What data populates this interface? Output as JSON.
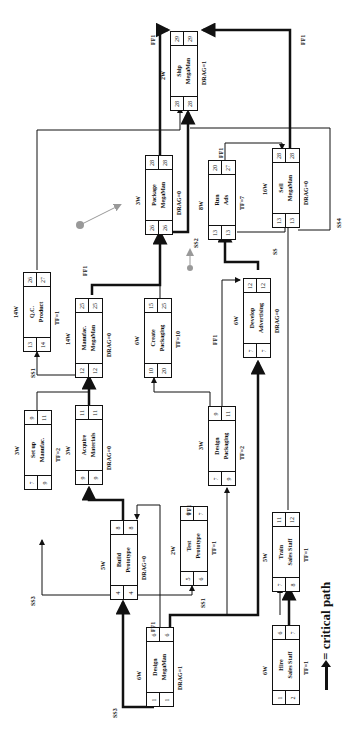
{
  "diagram": {
    "type": "project-network-critical-path",
    "orientation": "rotated-90-ccw",
    "nodes": [
      {
        "id": "design-megaman",
        "duration": "6W",
        "name_line1": "Design",
        "name_line2": "MegaMan",
        "es": "1",
        "ls": "1",
        "ef": "6",
        "lf": "6",
        "note": "DRAG=1"
      },
      {
        "id": "build-prototype",
        "duration": "5W",
        "name_line1": "Build",
        "name_line2": "Prototype",
        "es": "4",
        "ls": "4",
        "ef": "8",
        "lf": "8",
        "note": "DRAG=0"
      },
      {
        "id": "test-prototype",
        "duration": "2W",
        "name_line1": "Test",
        "name_line2": "Prototype",
        "es": "5",
        "ls": "6",
        "ef": "6",
        "lf": "7",
        "note": "TF=1"
      },
      {
        "id": "hire-sales-staff",
        "duration": "6W",
        "name_line1": "Hire",
        "name_line2": "Sales Staff",
        "es": "1",
        "ls": "2",
        "ef": "6",
        "lf": "7",
        "note": "TF=1"
      },
      {
        "id": "train-sales-staff",
        "duration": "5W",
        "name_line1": "Train",
        "name_line2": "Sales Staff",
        "es": "7",
        "ls": "8",
        "ef": "11",
        "lf": "12",
        "note": "TF=1"
      },
      {
        "id": "setup-manufac",
        "duration": "3W",
        "name_line1": "Set up",
        "name_line2": "Manufac.",
        "es": "7",
        "ls": "9",
        "ef": "9",
        "lf": "11",
        "note": "TF=2"
      },
      {
        "id": "acquire-materials",
        "duration": "3W",
        "name_line1": "Acquire",
        "name_line2": "Materials",
        "es": "9",
        "ls": "9",
        "ef": "11",
        "lf": "11",
        "note": "DRAG=0"
      },
      {
        "id": "design-packaging",
        "duration": "3W",
        "name_line1": "Design",
        "name_line2": "Packaging",
        "es": "7",
        "ls": "9",
        "ef": "9",
        "lf": "11",
        "note": "TF=2"
      },
      {
        "id": "qc-product",
        "duration": "14W",
        "name_line1": "Q.C.",
        "name_line2": "Product",
        "es": "13",
        "ls": "14",
        "ef": "26",
        "lf": "27",
        "note": "TF=1"
      },
      {
        "id": "manufac-megaman",
        "duration": "14W",
        "name_line1": "Manufac.",
        "name_line2": "MegaMan",
        "es": "12",
        "ls": "12",
        "ef": "25",
        "lf": "25",
        "note": "DRAG=0"
      },
      {
        "id": "create-packaging",
        "duration": "6W",
        "name_line1": "Create",
        "name_line2": "Packaging",
        "es": "10",
        "ls": "20",
        "ef": "15",
        "lf": "25",
        "note": "TF=10"
      },
      {
        "id": "develop-advertising",
        "duration": "6W",
        "name_line1": "Develop",
        "name_line2": "Advertising",
        "es": "7",
        "ls": "7",
        "ef": "12",
        "lf": "12",
        "note": "DRAG=0"
      },
      {
        "id": "package-megaman",
        "duration": "3W",
        "name_line1": "Package",
        "name_line2": "MegaMan",
        "es": "26",
        "ls": "26",
        "ef": "28",
        "lf": "28",
        "note": "DRAG=0"
      },
      {
        "id": "run-ads",
        "duration": "8W",
        "name_line1": "Run",
        "name_line2": "Ads",
        "es": "13",
        "ls": "13",
        "ef": "20",
        "lf": "27",
        "note": "TF=7"
      },
      {
        "id": "sell-megaman",
        "duration": "16W",
        "name_line1": "Sell",
        "name_line2": "MegaMan",
        "es": "13",
        "ls": "13",
        "ef": "28",
        "lf": "28",
        "note": "DRAG=0"
      },
      {
        "id": "ship-megaman",
        "duration": "2W",
        "name_line1": "Ship",
        "name_line2": "MegaMan",
        "es": "28",
        "ls": "28",
        "ef": "29",
        "lf": "29",
        "note": "DRAG=1"
      }
    ],
    "link_labels": [
      "SS3",
      "SS3",
      "SS1",
      "FF1",
      "FF1",
      "SS1",
      "FF1",
      "FF1",
      "SS2",
      "FF1",
      "FF1",
      "SS",
      "SS4",
      "FF1"
    ],
    "legend": {
      "label": "= critical path",
      "icon": "thick-arrow-icon"
    },
    "colors": {
      "line": "#111111",
      "critical": "#111111",
      "marker": "#999999"
    }
  }
}
